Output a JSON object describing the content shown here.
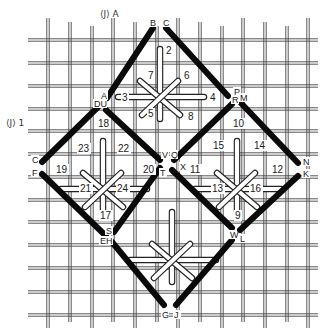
{
  "colors": {
    "background": "#ffffff",
    "canvas_thread": "#444444",
    "outline_stitch": "#0a0a0a",
    "cross_stitch_fill": "#ffffff",
    "cross_stitch_edge": "#222222"
  },
  "grid": {
    "vertical_x": [
      48,
      70,
      92,
      113,
      135,
      157,
      178,
      200,
      222,
      243,
      265,
      287,
      308
    ],
    "horizontal_y": [
      40,
      63,
      86,
      109,
      131,
      154,
      177,
      200,
      222,
      245,
      268,
      292,
      315
    ],
    "x_range": [
      28,
      318
    ],
    "y_range": [
      18,
      328
    ]
  },
  "markers": [
    {
      "id": "marker-a",
      "text": "⟨J⟩",
      "suffix": "A",
      "x": 100,
      "y": 17
    },
    {
      "id": "marker-1",
      "text": "⟨J⟩",
      "suffix": "1",
      "x": 6,
      "y": 126
    }
  ],
  "outline_segments": [
    {
      "from": [
        153,
        28
      ],
      "to": [
        107,
        98
      ]
    },
    {
      "from": [
        166,
        28
      ],
      "to": [
        228,
        96
      ]
    },
    {
      "from": [
        98,
        107
      ],
      "to": [
        42,
        162
      ]
    },
    {
      "from": [
        106,
        110
      ],
      "to": [
        160,
        160
      ]
    },
    {
      "from": [
        240,
        102
      ],
      "to": [
        298,
        163
      ]
    },
    {
      "from": [
        232,
        104
      ],
      "to": [
        174,
        160
      ]
    },
    {
      "from": [
        42,
        174
      ],
      "to": [
        106,
        236
      ]
    },
    {
      "from": [
        160,
        168
      ],
      "to": [
        114,
        232
      ]
    },
    {
      "from": [
        172,
        170
      ],
      "to": [
        232,
        228
      ]
    },
    {
      "from": [
        298,
        176
      ],
      "to": [
        240,
        230
      ]
    },
    {
      "from": [
        112,
        242
      ],
      "to": [
        164,
        305
      ]
    },
    {
      "from": [
        232,
        240
      ],
      "to": [
        176,
        305
      ]
    }
  ],
  "vertex_labels": [
    {
      "text": "B",
      "x": 150,
      "y": 26
    },
    {
      "text": "C",
      "x": 163,
      "y": 26
    },
    {
      "text": "A",
      "x": 101,
      "y": 99
    },
    {
      "text": "DU",
      "x": 94,
      "y": 107
    },
    {
      "text": "P",
      "x": 234,
      "y": 95
    },
    {
      "text": "R",
      "x": 232,
      "y": 103
    },
    {
      "text": "M",
      "x": 240,
      "y": 101
    },
    {
      "text": "C",
      "x": 32,
      "y": 163
    },
    {
      "text": "F",
      "x": 32,
      "y": 176
    },
    {
      "text": "V",
      "x": 162,
      "y": 158
    },
    {
      "text": "Q",
      "x": 171,
      "y": 158
    },
    {
      "text": "X",
      "x": 180,
      "y": 170
    },
    {
      "text": "T",
      "x": 160,
      "y": 176
    },
    {
      "text": "N",
      "x": 303,
      "y": 165
    },
    {
      "text": "K",
      "x": 303,
      "y": 177
    },
    {
      "text": "S",
      "x": 106,
      "y": 234
    },
    {
      "text": "EH",
      "x": 100,
      "y": 244
    },
    {
      "text": "W",
      "x": 230,
      "y": 238
    },
    {
      "text": "L",
      "x": 240,
      "y": 242
    },
    {
      "text": "G",
      "x": 162,
      "y": 318
    },
    {
      "text": "J",
      "x": 174,
      "y": 318
    }
  ],
  "stitch_units": [
    {
      "name": "top",
      "center": [
        160,
        77
      ],
      "numbers": [
        {
          "text": "2",
          "x": 166,
          "y": 54
        },
        {
          "text": "7",
          "x": 148,
          "y": 79
        },
        {
          "text": "6",
          "x": 184,
          "y": 79
        },
        {
          "text": "3",
          "x": 122,
          "y": 101
        },
        {
          "text": "4",
          "x": 210,
          "y": 101
        },
        {
          "text": "5",
          "x": 148,
          "y": 117
        },
        {
          "text": "8",
          "x": 188,
          "y": 120
        }
      ]
    },
    {
      "name": "left",
      "center": [
        103,
        169
      ],
      "numbers": [
        {
          "text": "18",
          "x": 98,
          "y": 127
        },
        {
          "text": "23",
          "x": 78,
          "y": 152
        },
        {
          "text": "22",
          "x": 118,
          "y": 152
        },
        {
          "text": "19",
          "x": 56,
          "y": 173
        },
        {
          "text": "20",
          "x": 143,
          "y": 173
        },
        {
          "text": "21",
          "x": 80,
          "y": 192
        },
        {
          "text": "24",
          "x": 117,
          "y": 192
        },
        {
          "text": "17",
          "x": 100,
          "y": 219
        }
      ]
    },
    {
      "name": "right",
      "center": [
        237,
        169
      ],
      "numbers": [
        {
          "text": "10",
          "x": 233,
          "y": 127
        },
        {
          "text": "15",
          "x": 213,
          "y": 149
        },
        {
          "text": "14",
          "x": 254,
          "y": 149
        },
        {
          "text": "11",
          "x": 190,
          "y": 173
        },
        {
          "text": "12",
          "x": 272,
          "y": 173
        },
        {
          "text": "13",
          "x": 212,
          "y": 192
        },
        {
          "text": "16",
          "x": 250,
          "y": 192
        },
        {
          "text": "9",
          "x": 235,
          "y": 219
        }
      ]
    },
    {
      "name": "bottom",
      "center": [
        172,
        240
      ],
      "numbers": []
    }
  ]
}
